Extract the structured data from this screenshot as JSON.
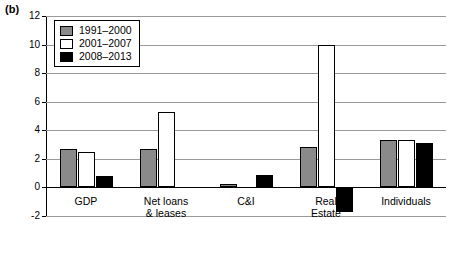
{
  "panel": {
    "label": "(b)"
  },
  "chart_data": {
    "type": "bar",
    "title": "",
    "xlabel": "",
    "ylabel": "",
    "ylim": [
      -2,
      12
    ],
    "yticks": [
      -2,
      0,
      2,
      4,
      6,
      8,
      10,
      12
    ],
    "ytick_labels": [
      "-2",
      "0",
      "2",
      "4",
      "6",
      "8",
      "10",
      "12"
    ],
    "grid": true,
    "legend_position": "top-left",
    "categories": [
      "GDP",
      "Net loans\n& leases",
      "C&I",
      "Real\nEstate",
      "Individuals"
    ],
    "series": [
      {
        "name": "1991–2000",
        "color": "#8a8a8a",
        "values": [
          2.7,
          2.7,
          0.25,
          2.85,
          3.35
        ]
      },
      {
        "name": "2001–2007",
        "color": "#ffffff",
        "values": [
          2.5,
          5.3,
          0.0,
          9.95,
          3.3
        ]
      },
      {
        "name": "2008–2013",
        "color": "#000000",
        "values": [
          0.8,
          0.0,
          0.9,
          -1.75,
          3.1
        ]
      }
    ]
  }
}
